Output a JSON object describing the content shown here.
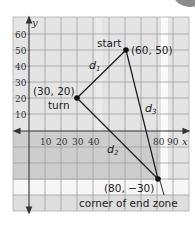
{
  "diagram": {
    "axes": {
      "x_label": "x",
      "y_label": "y",
      "x_ticks": [
        "10",
        "20",
        "30",
        "40",
        "80",
        "90"
      ],
      "y_ticks": [
        "60",
        "50",
        "40",
        "30",
        "20",
        "10"
      ]
    },
    "points": [
      {
        "name": "start",
        "coord_label": "(60, 50)",
        "x": 60,
        "y": 50
      },
      {
        "name": "turn",
        "coord_label": "(30, 20)",
        "x": 30,
        "y": 20
      },
      {
        "name": "corner of end zone",
        "coord_label": "(80, −30)",
        "x": 80,
        "y": -30
      }
    ],
    "segments": [
      {
        "label": "d",
        "sub": "1",
        "from": "start",
        "to": "turn"
      },
      {
        "label": "d",
        "sub": "2",
        "from": "turn",
        "to": "corner of end zone"
      },
      {
        "label": "d",
        "sub": "3",
        "from": "start",
        "to": "corner of end zone"
      }
    ],
    "colors": {
      "grid_bg_upper": "#e6e6e6",
      "grid_bg_lower": "#cfcfcf",
      "grid_line": "#9a9a9a",
      "line": "#1a1a1a"
    }
  }
}
